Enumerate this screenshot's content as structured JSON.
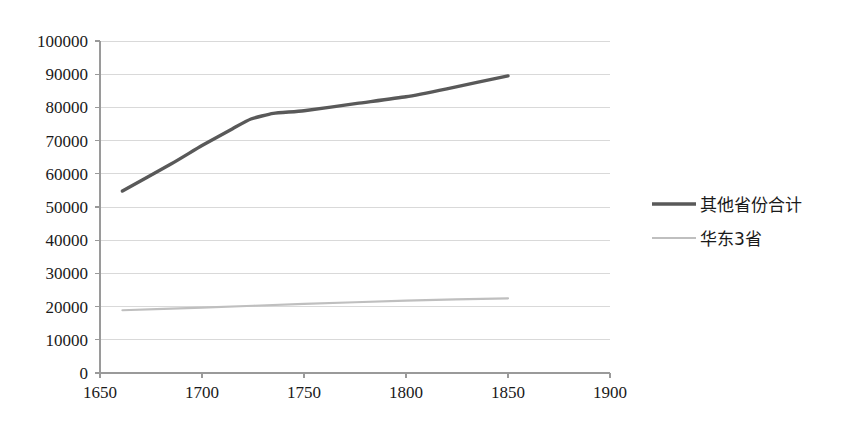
{
  "chart_data": {
    "type": "line",
    "title": "",
    "subtitle": "",
    "xlabel": "",
    "ylabel": "",
    "xlim": [
      1650,
      1900
    ],
    "ylim": [
      0,
      100000
    ],
    "grid": true,
    "legend_position": "right",
    "x_ticks": [
      "1650",
      "1700",
      "1750",
      "1800",
      "1850",
      "1900"
    ],
    "x_tick_values": [
      1650,
      1700,
      1750,
      1800,
      1850,
      1900
    ],
    "y_ticks": [
      "0",
      "10000",
      "20000",
      "30000",
      "40000",
      "50000",
      "60000",
      "70000",
      "80000",
      "90000",
      "100000"
    ],
    "y_tick_values": [
      0,
      10000,
      20000,
      30000,
      40000,
      50000,
      60000,
      70000,
      80000,
      90000,
      100000
    ],
    "series": [
      {
        "name": "其他省份合计",
        "color": "#595959",
        "width": 3.4,
        "x": [
          1661,
          1685,
          1700,
          1715,
          1724,
          1735,
          1750,
          1776,
          1800,
          1820,
          1850
        ],
        "values": [
          54800,
          63000,
          68500,
          73600,
          76500,
          78200,
          79000,
          81200,
          83200,
          85600,
          89500
        ]
      },
      {
        "name": "华东3省",
        "color": "#bfbfbf",
        "width": 2.2,
        "x": [
          1661,
          1700,
          1750,
          1800,
          1850
        ],
        "values": [
          18900,
          19700,
          20800,
          21800,
          22500
        ]
      }
    ]
  },
  "legend": {
    "items": [
      {
        "label": "其他省份合计",
        "color": "#595959"
      },
      {
        "label": "华东3省",
        "color": "#bfbfbf"
      }
    ]
  }
}
